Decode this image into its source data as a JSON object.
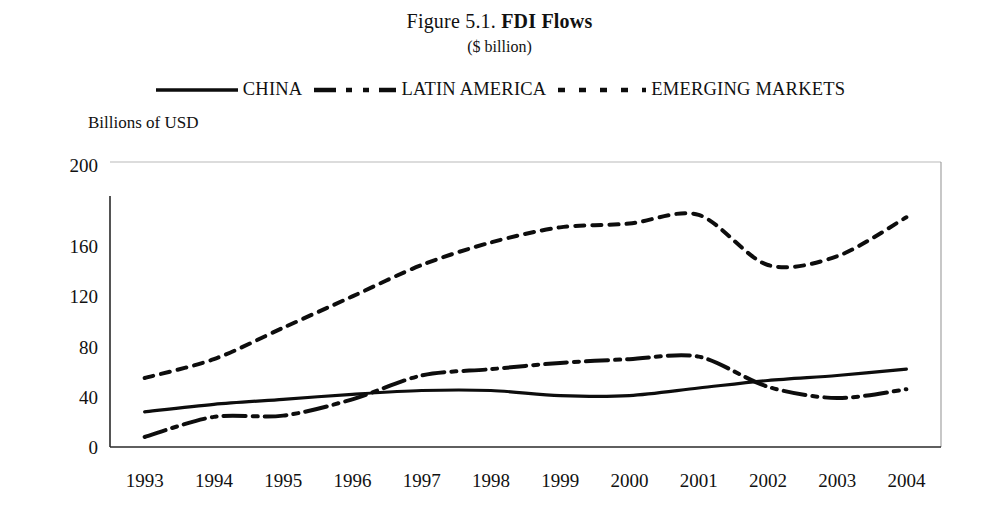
{
  "figure": {
    "title_prefix": "Figure 5.1.",
    "title_main": "FDI Flows",
    "subtitle": "($ billion)",
    "axis_title": "Billions of USD"
  },
  "legend": {
    "position": "top",
    "items": [
      {
        "label": "CHINA",
        "style": "solid",
        "icon": "solid-line-icon"
      },
      {
        "label": "LATIN AMERICA",
        "style": "dash-dot",
        "icon": "dash-dot-line-icon"
      },
      {
        "label": "EMERGING MARKETS",
        "style": "dotted",
        "icon": "dotted-line-icon"
      }
    ]
  },
  "chart_data": {
    "type": "line",
    "title": "Figure 5.1. FDI Flows",
    "subtitle": "($ billion)",
    "xlabel": "",
    "ylabel": "Billions of USD",
    "ylim": [
      0,
      200
    ],
    "yticks": [
      0,
      40,
      80,
      120,
      160,
      200
    ],
    "grid": false,
    "legend_position": "top",
    "categories": [
      "1993",
      "1994",
      "1995",
      "1996",
      "1997",
      "1998",
      "1999",
      "2000",
      "2001",
      "2002",
      "2003",
      "2004"
    ],
    "series": [
      {
        "name": "CHINA",
        "style": "solid",
        "values": [
          28,
          34,
          38,
          42,
          45,
          45,
          41,
          41,
          47,
          53,
          57,
          62
        ]
      },
      {
        "name": "LATIN AMERICA",
        "style": "dash-dot",
        "values": [
          8,
          24,
          25,
          38,
          57,
          62,
          67,
          70,
          72,
          48,
          39,
          46
        ]
      },
      {
        "name": "EMERGING MARKETS",
        "style": "dotted",
        "values": [
          55,
          70,
          95,
          120,
          145,
          163,
          175,
          178,
          185,
          145,
          152,
          183
        ]
      }
    ]
  },
  "ytick_labels": [
    "0",
    "40",
    "80",
    "120",
    "160",
    "200"
  ],
  "xtick_labels": [
    "1993",
    "1994",
    "1995",
    "1996",
    "1997",
    "1998",
    "1999",
    "2000",
    "2001",
    "2002",
    "2003",
    "2004"
  ],
  "colors": {
    "ink": "#0d0d0d",
    "axis": "#2a2a2a",
    "box": "#9a9a9a",
    "background": "#ffffff"
  }
}
